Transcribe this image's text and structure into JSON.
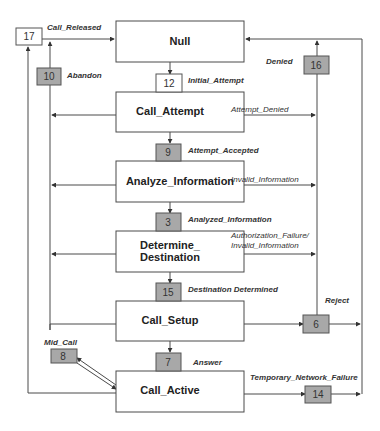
{
  "states": {
    "null": "Null",
    "call_attempt": "Call_Attempt",
    "analyze_information": "Analyze_Information",
    "determine_destination_1": "Determine_",
    "determine_destination_2": "Destination",
    "call_setup": "Call_Setup",
    "call_active": "Call_Active"
  },
  "pics": {
    "p17": "17",
    "p10": "10",
    "p12": "12",
    "p16": "16",
    "p9": "9",
    "p3": "3",
    "p15": "15",
    "p6": "6",
    "p8": "8",
    "p7": "7",
    "p14": "14"
  },
  "labels": {
    "call_released": "Call_Released",
    "abandon": "Abandon",
    "initial_attempt": "Initial_Attempt",
    "denied": "Denied",
    "attempt_denied": "Attempt_Denied",
    "attempt_accepted": "Attempt_Accepted",
    "invalid_information": "Invalid_Information",
    "analyzed_information": "Analyzed_Information",
    "auth_failure_1": "Authorization_Failure/",
    "auth_failure_2": "Invalid_Information",
    "destination_determined": "Destination Determined",
    "reject": "Reject",
    "mid_call": "Mid_Call",
    "answer": "Answer",
    "temporary_network_failure": "Temporary_Network_Failure"
  }
}
